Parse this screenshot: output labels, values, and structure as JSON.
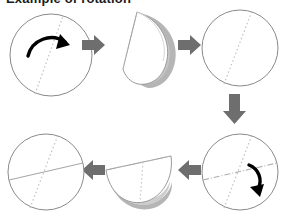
{
  "diagram": {
    "title_clipped": "Example of rotation",
    "type": "paper-folding-rotation-sequence",
    "background": "#ffffff",
    "colors": {
      "outline": "#7a7a7a",
      "fold_line": "#b8b8b8",
      "crease_line": "#9a9a9a",
      "shadow": "#9d9d9d",
      "block_arrow": "#6e6e6e",
      "rotation_arrow": "#000000",
      "paper_fill": "#ffffff"
    },
    "steps": [
      {
        "id": "step-1",
        "name": "circle-with-rotation-arrow",
        "label": "Circle with diagonal crease and clockwise rotation arrow",
        "shape": "circle",
        "creases": 1,
        "rotation_arrow": true,
        "rotation_direction": "clockwise"
      },
      {
        "id": "step-2",
        "name": "folded-half-right",
        "label": "Circle folded in half along the diagonal, right half lifted",
        "shape": "half-disc-vertical",
        "creases": 1,
        "rotation_arrow": false
      },
      {
        "id": "step-3",
        "name": "circle-one-crease",
        "label": "Unfolded circle showing one diagonal crease",
        "shape": "circle",
        "creases": 1,
        "rotation_arrow": false
      },
      {
        "id": "step-4",
        "name": "circle-two-creases-rotation",
        "label": "Circle with two creases and clockwise rotation arrow",
        "shape": "circle",
        "creases": 2,
        "rotation_arrow": true,
        "rotation_direction": "clockwise"
      },
      {
        "id": "step-5",
        "name": "folded-half-bottom",
        "label": "Circle folded in half downward showing crease",
        "shape": "half-disc-horizontal",
        "creases": 1,
        "rotation_arrow": false
      },
      {
        "id": "step-6",
        "name": "circle-two-creases-final",
        "label": "Final unfolded circle showing two crossing creases",
        "shape": "circle",
        "creases": 2,
        "rotation_arrow": false
      }
    ],
    "arrows": [
      {
        "id": "arrow-1",
        "name": "arrow-right-step1-to-step2",
        "direction": "right"
      },
      {
        "id": "arrow-2",
        "name": "arrow-right-step2-to-step3",
        "direction": "right"
      },
      {
        "id": "arrow-3",
        "name": "arrow-down-step3-to-step4",
        "direction": "down"
      },
      {
        "id": "arrow-4",
        "name": "arrow-left-step4-to-step5",
        "direction": "left"
      },
      {
        "id": "arrow-5",
        "name": "arrow-left-step5-to-step6",
        "direction": "left"
      }
    ]
  }
}
